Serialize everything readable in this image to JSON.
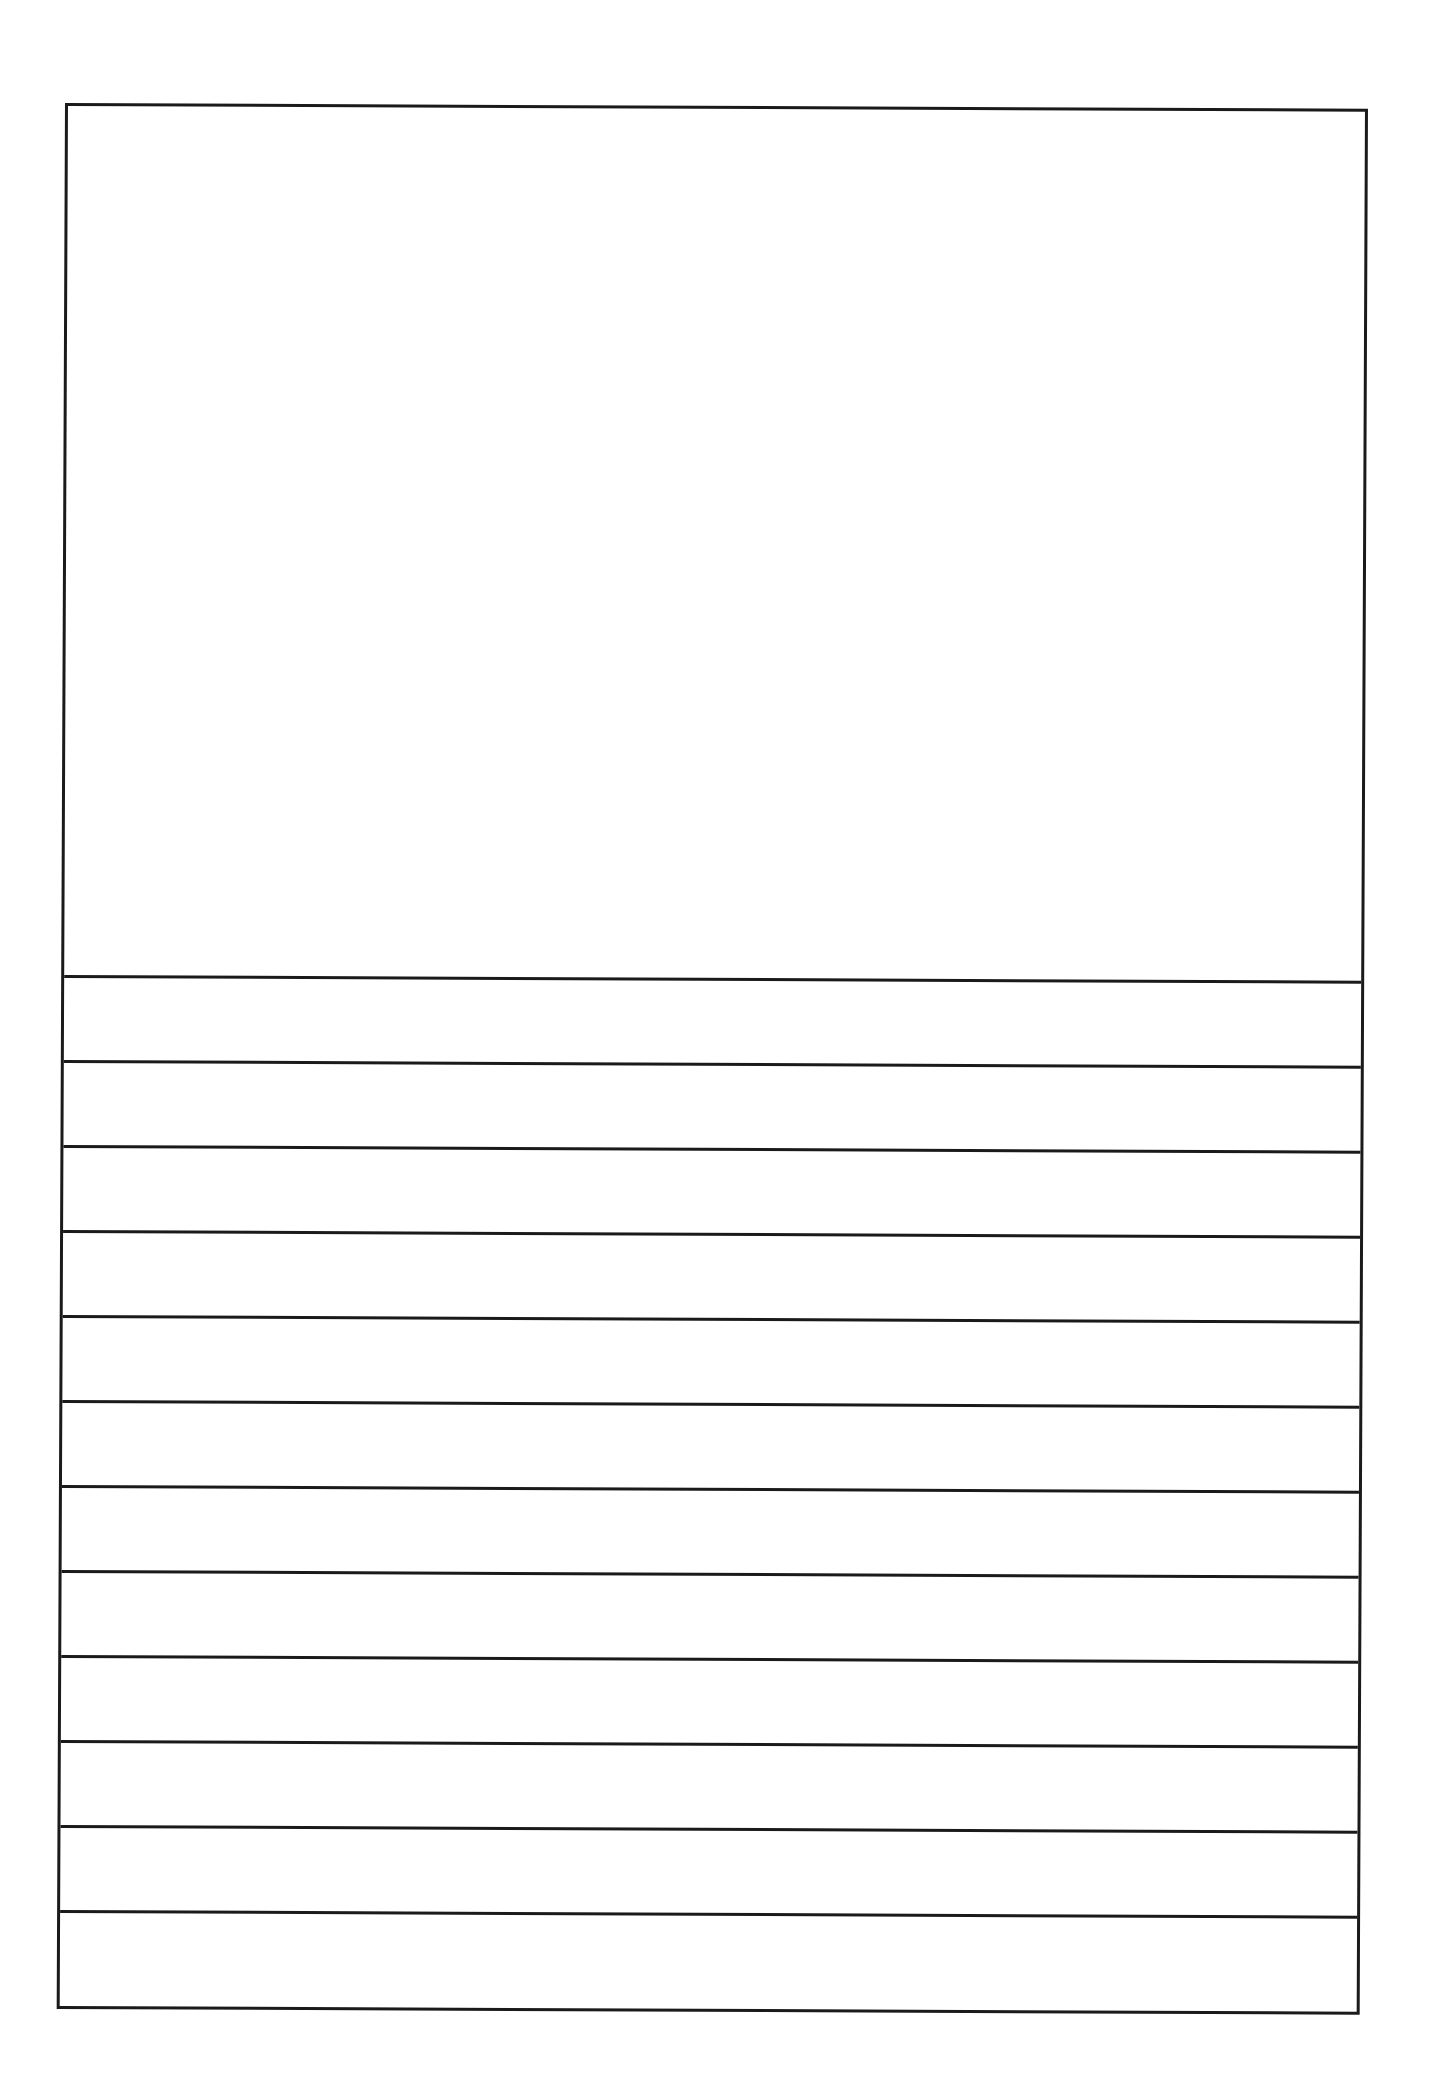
{
  "document": {
    "type": "handwriting-template",
    "picture_box": {
      "content": ""
    },
    "writing_lines": [
      {
        "index": 1,
        "text": ""
      },
      {
        "index": 2,
        "text": ""
      },
      {
        "index": 3,
        "text": ""
      },
      {
        "index": 4,
        "text": ""
      },
      {
        "index": 5,
        "text": ""
      },
      {
        "index": 6,
        "text": ""
      },
      {
        "index": 7,
        "text": ""
      },
      {
        "index": 8,
        "text": ""
      },
      {
        "index": 9,
        "text": ""
      },
      {
        "index": 10,
        "text": ""
      },
      {
        "index": 11,
        "text": ""
      },
      {
        "index": 12,
        "text": ""
      }
    ],
    "colors": {
      "line": "#1a1a1a",
      "paper": "#ffffff"
    }
  }
}
